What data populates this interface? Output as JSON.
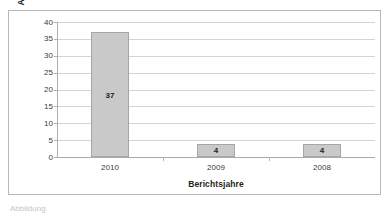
{
  "chart_data": {
    "type": "bar",
    "title": "",
    "categories": [
      "2010",
      "2009",
      "2008"
    ],
    "values": [
      37,
      4,
      4
    ],
    "data_labels": [
      "37",
      "4",
      "4"
    ],
    "xlabel": "Berichtsjahre",
    "ylabel": "Anzahl der Unternehmen",
    "ylim": [
      0,
      40
    ],
    "ytick_labels": [
      "40",
      "35",
      "30",
      "25",
      "20",
      "15",
      "10",
      "5",
      "0"
    ],
    "ytick_values": [
      40,
      35,
      30,
      25,
      20,
      15,
      10,
      5,
      0
    ],
    "grid": "horizontal",
    "legend": "none",
    "series": [
      {
        "name": "Anzahl der Unternehmen",
        "values": [
          37,
          4,
          4
        ],
        "color": "#c9c9c9",
        "border_color": "#a6a6a6"
      }
    ],
    "colors": {
      "bar_fill": "#c9c9c9",
      "bar_border": "#a6a6a6",
      "gridline": "#d4d4d4",
      "axis_line": "#a9a9a9",
      "frame_border": "#b8b8b8",
      "text": "#231f20",
      "background": "#ffffff"
    }
  },
  "caption": {
    "partial_text": "Abbildung"
  }
}
